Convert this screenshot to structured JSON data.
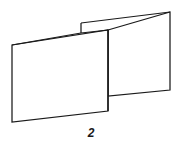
{
  "figure": {
    "caption": "2",
    "stroke_color": "#1a1a1a",
    "fill_color": "#ffffff",
    "background_color": "#ffffff",
    "width": 182,
    "height": 147,
    "shapes": {
      "left_panel": {
        "name": "left-panel",
        "points": "12,45 108,30 108,111 12,122"
      },
      "right_panel": {
        "name": "right-panel",
        "points": "108,30 170,12 170,90 108,96"
      },
      "fold_flap_upper_edge": {
        "name": "fold-flap-upper-edge",
        "points": "81,23 170,12"
      },
      "fold_flap_lower_edge": {
        "name": "fold-flap-lower-edge",
        "points": "81,33 108,30"
      },
      "fold_flap_left_edge": {
        "name": "fold-flap-left-edge",
        "points": "81,23 81,33"
      },
      "left_panel_top_edge": {
        "name": "left-panel-top-edge",
        "points": "12,45 81,33"
      },
      "center_crease": {
        "name": "center-crease",
        "points": "108,30 108,111"
      }
    }
  }
}
